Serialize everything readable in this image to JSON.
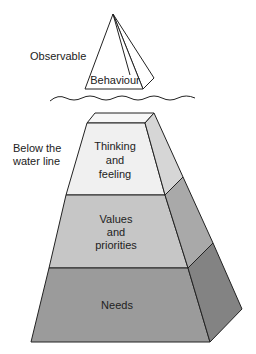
{
  "diagram": {
    "type": "iceberg",
    "labels": {
      "observable": "Observable",
      "below_line_1": "Below the",
      "below_line_2": "water line"
    },
    "tip": {
      "label": "Behaviour"
    },
    "layers": [
      {
        "line1": "Thinking",
        "line2": "and",
        "line3": "feeling",
        "front_color": "#f0f0f0",
        "side_color": "#d6d6d6"
      },
      {
        "line1": "Values",
        "line2": "and",
        "line3": "priorities",
        "front_color": "#c6c6c6",
        "side_color": "#a9a9a9"
      },
      {
        "line1": "Needs",
        "front_color": "#9b9b9b",
        "side_color": "#838383"
      }
    ],
    "colors": {
      "tip_fill": "#ffffff",
      "top_face": "#f7f7f7",
      "stroke": "#222222"
    }
  }
}
